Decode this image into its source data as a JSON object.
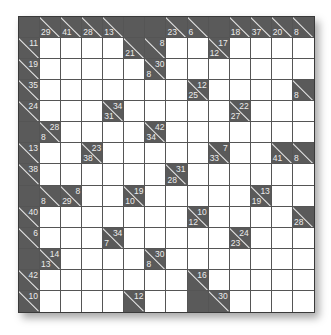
{
  "puzzle": {
    "type": "Kakuro",
    "rows": 14,
    "cols": 14,
    "colors": {
      "block": "#5a5a5a",
      "clue_text": "#ececec",
      "white": "#ffffff",
      "grid_line": "#555555"
    },
    "grid": [
      [
        {
          "t": "x"
        },
        {
          "t": "c",
          "d": "29"
        },
        {
          "t": "c",
          "d": "41"
        },
        {
          "t": "c",
          "d": "28"
        },
        {
          "t": "c",
          "d": "13"
        },
        {
          "t": "x"
        },
        {
          "t": "x"
        },
        {
          "t": "c",
          "d": "23"
        },
        {
          "t": "c",
          "d": "6"
        },
        {
          "t": "x"
        },
        {
          "t": "c",
          "d": "18"
        },
        {
          "t": "c",
          "d": "37"
        },
        {
          "t": "c",
          "d": "20"
        },
        {
          "t": "c",
          "d": "8"
        }
      ],
      [
        {
          "t": "c",
          "r": "11"
        },
        {
          "t": "w"
        },
        {
          "t": "w"
        },
        {
          "t": "w"
        },
        {
          "t": "w"
        },
        {
          "t": "c",
          "d": "21"
        },
        {
          "t": "c",
          "r": "8"
        },
        {
          "t": "w"
        },
        {
          "t": "w"
        },
        {
          "t": "c",
          "r": "17",
          "d": "12"
        },
        {
          "t": "w"
        },
        {
          "t": "w"
        },
        {
          "t": "w"
        },
        {
          "t": "w"
        }
      ],
      [
        {
          "t": "c",
          "r": "19"
        },
        {
          "t": "w"
        },
        {
          "t": "w"
        },
        {
          "t": "w"
        },
        {
          "t": "w"
        },
        {
          "t": "w"
        },
        {
          "t": "c",
          "r": "30",
          "d": "8"
        },
        {
          "t": "w"
        },
        {
          "t": "w"
        },
        {
          "t": "w"
        },
        {
          "t": "w"
        },
        {
          "t": "w"
        },
        {
          "t": "w"
        },
        {
          "t": "w"
        }
      ],
      [
        {
          "t": "c",
          "r": "35"
        },
        {
          "t": "w"
        },
        {
          "t": "w"
        },
        {
          "t": "w"
        },
        {
          "t": "w"
        },
        {
          "t": "w"
        },
        {
          "t": "w"
        },
        {
          "t": "w"
        },
        {
          "t": "c",
          "r": "12",
          "d": "25"
        },
        {
          "t": "w"
        },
        {
          "t": "w"
        },
        {
          "t": "w"
        },
        {
          "t": "w"
        },
        {
          "t": "c",
          "d": "8"
        }
      ],
      [
        {
          "t": "c",
          "r": "24"
        },
        {
          "t": "w"
        },
        {
          "t": "w"
        },
        {
          "t": "w"
        },
        {
          "t": "c",
          "r": "34",
          "d": "31"
        },
        {
          "t": "w"
        },
        {
          "t": "w"
        },
        {
          "t": "w"
        },
        {
          "t": "w"
        },
        {
          "t": "w"
        },
        {
          "t": "c",
          "r": "22",
          "d": "27"
        },
        {
          "t": "w"
        },
        {
          "t": "w"
        },
        {
          "t": "w"
        }
      ],
      [
        {
          "t": "x"
        },
        {
          "t": "c",
          "r": "28",
          "d": "8"
        },
        {
          "t": "w"
        },
        {
          "t": "w"
        },
        {
          "t": "w"
        },
        {
          "t": "w"
        },
        {
          "t": "c",
          "r": "42",
          "d": "34"
        },
        {
          "t": "w"
        },
        {
          "t": "w"
        },
        {
          "t": "w"
        },
        {
          "t": "w"
        },
        {
          "t": "w"
        },
        {
          "t": "w"
        },
        {
          "t": "w"
        }
      ],
      [
        {
          "t": "c",
          "r": "13"
        },
        {
          "t": "w"
        },
        {
          "t": "w"
        },
        {
          "t": "c",
          "r": "23",
          "d": "38"
        },
        {
          "t": "w"
        },
        {
          "t": "w"
        },
        {
          "t": "w"
        },
        {
          "t": "w"
        },
        {
          "t": "w"
        },
        {
          "t": "c",
          "r": "7",
          "d": "33"
        },
        {
          "t": "w"
        },
        {
          "t": "w"
        },
        {
          "t": "c",
          "d": "41"
        },
        {
          "t": "c",
          "d": "8"
        }
      ],
      [
        {
          "t": "c",
          "r": "38"
        },
        {
          "t": "w"
        },
        {
          "t": "w"
        },
        {
          "t": "w"
        },
        {
          "t": "w"
        },
        {
          "t": "w"
        },
        {
          "t": "w"
        },
        {
          "t": "c",
          "r": "31",
          "d": "28"
        },
        {
          "t": "w"
        },
        {
          "t": "w"
        },
        {
          "t": "w"
        },
        {
          "t": "w"
        },
        {
          "t": "w"
        },
        {
          "t": "w"
        }
      ],
      [
        {
          "t": "x"
        },
        {
          "t": "c",
          "d": "8"
        },
        {
          "t": "c",
          "r": "8",
          "d": "29"
        },
        {
          "t": "w"
        },
        {
          "t": "w"
        },
        {
          "t": "c",
          "r": "19",
          "d": "10"
        },
        {
          "t": "w"
        },
        {
          "t": "w"
        },
        {
          "t": "w"
        },
        {
          "t": "w"
        },
        {
          "t": "w"
        },
        {
          "t": "c",
          "r": "13",
          "d": "19"
        },
        {
          "t": "w"
        },
        {
          "t": "w"
        }
      ],
      [
        {
          "t": "c",
          "r": "40"
        },
        {
          "t": "w"
        },
        {
          "t": "w"
        },
        {
          "t": "w"
        },
        {
          "t": "w"
        },
        {
          "t": "w"
        },
        {
          "t": "w"
        },
        {
          "t": "w"
        },
        {
          "t": "c",
          "r": "10",
          "d": "12"
        },
        {
          "t": "w"
        },
        {
          "t": "w"
        },
        {
          "t": "w"
        },
        {
          "t": "w"
        },
        {
          "t": "c",
          "d": "28"
        }
      ],
      [
        {
          "t": "c",
          "r": "6"
        },
        {
          "t": "w"
        },
        {
          "t": "w"
        },
        {
          "t": "w"
        },
        {
          "t": "c",
          "r": "34",
          "d": "7"
        },
        {
          "t": "w"
        },
        {
          "t": "w"
        },
        {
          "t": "w"
        },
        {
          "t": "w"
        },
        {
          "t": "w"
        },
        {
          "t": "c",
          "r": "24",
          "d": "23"
        },
        {
          "t": "w"
        },
        {
          "t": "w"
        },
        {
          "t": "w"
        }
      ],
      [
        {
          "t": "x"
        },
        {
          "t": "c",
          "r": "14",
          "d": "13"
        },
        {
          "t": "w"
        },
        {
          "t": "w"
        },
        {
          "t": "w"
        },
        {
          "t": "w"
        },
        {
          "t": "c",
          "r": "30",
          "d": "8"
        },
        {
          "t": "w"
        },
        {
          "t": "w"
        },
        {
          "t": "w"
        },
        {
          "t": "w"
        },
        {
          "t": "w"
        },
        {
          "t": "w"
        },
        {
          "t": "w"
        }
      ],
      [
        {
          "t": "c",
          "r": "42"
        },
        {
          "t": "w"
        },
        {
          "t": "w"
        },
        {
          "t": "w"
        },
        {
          "t": "w"
        },
        {
          "t": "w"
        },
        {
          "t": "w"
        },
        {
          "t": "w"
        },
        {
          "t": "c",
          "r": "16"
        },
        {
          "t": "w"
        },
        {
          "t": "w"
        },
        {
          "t": "w"
        },
        {
          "t": "w"
        },
        {
          "t": "w"
        }
      ],
      [
        {
          "t": "c",
          "r": "10"
        },
        {
          "t": "w"
        },
        {
          "t": "w"
        },
        {
          "t": "w"
        },
        {
          "t": "w"
        },
        {
          "t": "c",
          "r": "12"
        },
        {
          "t": "w"
        },
        {
          "t": "w"
        },
        {
          "t": "x"
        },
        {
          "t": "c",
          "r": "30"
        },
        {
          "t": "w"
        },
        {
          "t": "w"
        },
        {
          "t": "w"
        },
        {
          "t": "w"
        }
      ]
    ]
  }
}
